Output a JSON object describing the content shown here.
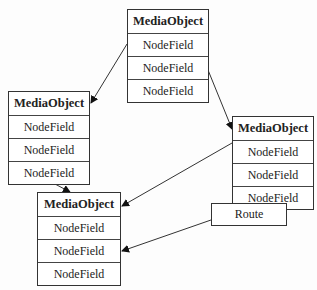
{
  "diagram": {
    "nodes": [
      {
        "id": "A",
        "title": "MediaObject",
        "fields": [
          "NodeField",
          "NodeField",
          "NodeField"
        ]
      },
      {
        "id": "B",
        "title": "MediaObject",
        "fields": [
          "NodeField",
          "NodeField",
          "NodeField"
        ]
      },
      {
        "id": "C",
        "title": "MediaObject",
        "fields": [
          "NodeField",
          "NodeField",
          "NodeField"
        ]
      },
      {
        "id": "D",
        "title": "MediaObject",
        "fields": [
          "NodeField",
          "NodeField",
          "NodeField"
        ]
      }
    ],
    "route": {
      "label": "Route"
    },
    "edges": [
      {
        "from": "A.field1",
        "to": "B.header"
      },
      {
        "from": "A.field2",
        "to": "C.header"
      },
      {
        "from": "B.bottom",
        "to": "D.top"
      },
      {
        "from": "C.field2",
        "to": "D.header"
      },
      {
        "from": "C.bottom",
        "to": "Route"
      },
      {
        "from": "Route",
        "to": "D.field2"
      }
    ]
  }
}
